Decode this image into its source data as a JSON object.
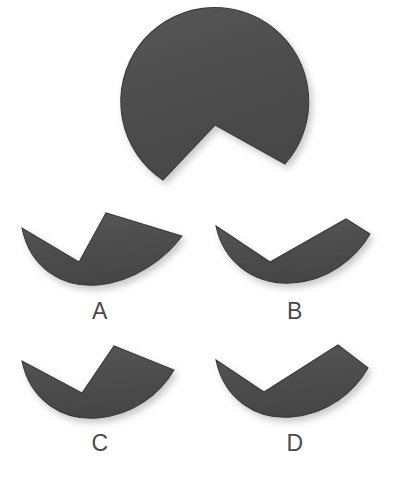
{
  "page": {
    "background_color": "#ffffff",
    "width": 402,
    "height": 480
  },
  "style": {
    "shape_fill": "#4d4d4d",
    "shape_fill_light": "#585858",
    "shape_edge": "#3a3a3a",
    "label_color": "#4a4a4a",
    "shadow_color": "#bfbfbf"
  },
  "prompt": {
    "name": "notched-disc",
    "description": "Large dark gray disc with a V-shaped wedge notch cut out of the bottom",
    "center_x": 203,
    "center_y": 127,
    "radius": 94,
    "notch_vertex_x": 215,
    "notch_vertex_y": 125,
    "notch_left_x": 163,
    "notch_left_y": 180,
    "notch_right_x": 285,
    "notch_right_y": 164
  },
  "options": [
    {
      "id": "A",
      "label": "A",
      "name": "option-a",
      "description": "Crescent with V-notch, vertex left of center, thick right lobe",
      "shape_cx": 104,
      "shape_cy": 205,
      "shape_rx": 80,
      "shape_ry": 72,
      "notch_vertex_x": 79,
      "notch_vertex_y": 262,
      "notch_left_x": 22,
      "notch_left_y": 228,
      "notch_right_x": 106,
      "notch_right_y": 213
    },
    {
      "id": "B",
      "label": "B",
      "name": "option-b",
      "description": "Thin checkmark-like crescent, notch vertex low left of center",
      "shape_cx": 298,
      "shape_cy": 205,
      "shape_rx": 80,
      "shape_ry": 72,
      "notch_vertex_x": 270,
      "notch_vertex_y": 262,
      "notch_left_x": 216,
      "notch_left_y": 226,
      "notch_right_x": 346,
      "notch_right_y": 219
    },
    {
      "id": "C",
      "label": "C",
      "name": "option-c",
      "description": "Crescent with V-notch, vertex left of center, wide right lobe",
      "shape_cx": 104,
      "shape_cy": 338,
      "shape_rx": 80,
      "shape_ry": 72,
      "notch_vertex_x": 82,
      "notch_vertex_y": 393,
      "notch_left_x": 22,
      "notch_left_y": 361,
      "notch_right_x": 114,
      "notch_right_y": 346
    },
    {
      "id": "D",
      "label": "D",
      "name": "option-d",
      "description": "Crescent with V-notch, vertex far left, very wide right lobe",
      "shape_cx": 298,
      "shape_cy": 338,
      "shape_rx": 80,
      "shape_ry": 72,
      "notch_vertex_x": 264,
      "notch_vertex_y": 392,
      "notch_left_x": 216,
      "notch_left_y": 360,
      "notch_right_x": 338,
      "notch_right_y": 345
    }
  ]
}
